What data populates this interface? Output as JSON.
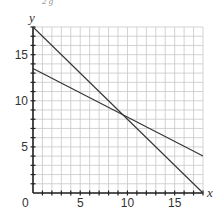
{
  "chart_data": {
    "type": "line",
    "title": "",
    "xlabel": "x",
    "ylabel": "y",
    "xlim": [
      0,
      18
    ],
    "ylim": [
      0,
      18
    ],
    "grid": true,
    "grid_step": 1,
    "x_ticks": [
      0,
      5,
      10,
      15
    ],
    "y_ticks": [
      5,
      10,
      15
    ],
    "origin_label": "0",
    "series": [
      {
        "name": "line-1",
        "points": [
          [
            0,
            18
          ],
          [
            18,
            0
          ]
        ],
        "equation": "y = 18 - x"
      },
      {
        "name": "line-2",
        "points": [
          [
            0,
            13.5
          ],
          [
            18,
            4
          ]
        ],
        "equation": "approx y = 13.5 - 0.53x"
      }
    ],
    "annotations": [
      {
        "text": "intersection",
        "x": 10,
        "y": 8
      }
    ],
    "colors": {
      "line": "#333333",
      "grid": "#c8c8c8",
      "axis": "#222222"
    },
    "cropped_top_text": "2     g"
  }
}
